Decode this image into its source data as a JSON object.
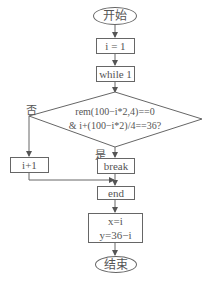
{
  "flowchart": {
    "start": "开始",
    "init": "i = 1",
    "loop": "while 1",
    "condition": {
      "line1": "rem(100−i*2,4)==0",
      "line2": "& i+(100−i*2)/4==36?"
    },
    "no_label": "否",
    "yes_label": "是",
    "increment": "i+1",
    "break": "break",
    "end_loop": "end",
    "result": {
      "line1": "x=i",
      "line2": "y=36−i"
    },
    "finish": "结束"
  },
  "colors": {
    "line": "#666666",
    "text": "#555555"
  }
}
